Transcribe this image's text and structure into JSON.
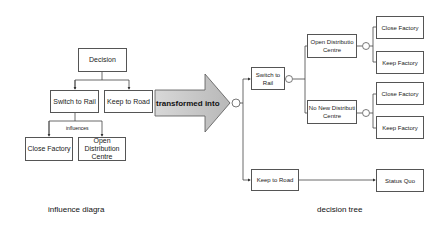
{
  "influence": {
    "decision": "Decision",
    "switch_rail": "Switch to Rail",
    "keep_road": "Keep to Road",
    "influences": "influences",
    "close_factory": "Close Factory",
    "open_dc": "Open Distribution Centre",
    "caption": "influence diagra"
  },
  "arrow": {
    "label": "transformed into"
  },
  "tree": {
    "switch_rail": "Switch to Rail",
    "keep_road": "Keep to Road",
    "open_dc": "Open Distributio Centre",
    "no_new_dc": "No New Distributi Centre",
    "close_factory_1": "Close Factory",
    "keep_factory_1": "Keep Factory",
    "close_factory_2": "Close Factory",
    "keep_factory_2": "Keep Factory",
    "status_quo": "Status Quo",
    "caption": "decision tree"
  },
  "colors": {
    "line": "#444444",
    "arrow_fill": "#c8c8c8",
    "box_border": "#555555"
  }
}
